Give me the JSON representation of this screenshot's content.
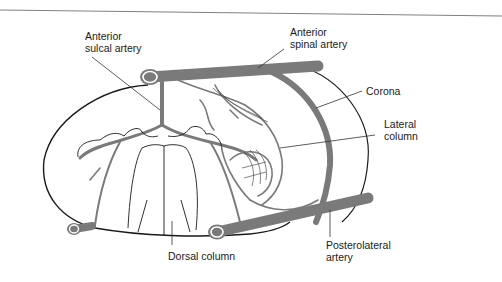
{
  "diagram": {
    "colors": {
      "vessel": "#7a7a7a",
      "vessel_lumen_ring": "#ffffff",
      "outline": "#1a1a1a",
      "leader_line": "#333333",
      "background": "#ffffff",
      "top_rule": "#808080"
    },
    "labels": {
      "anterior_sulcal_artery": {
        "line1": "Anterior",
        "line2": "sulcal artery"
      },
      "anterior_spinal_artery": {
        "line1": "Anterior",
        "line2": "spinal artery"
      },
      "corona": {
        "line1": "Corona"
      },
      "lateral_column": {
        "line1": "Lateral",
        "line2": "column"
      },
      "dorsal_column": {
        "line1": "Dorsal column"
      },
      "posterolateral_artery": {
        "line1": "Posterolateral",
        "line2": "artery"
      }
    }
  }
}
